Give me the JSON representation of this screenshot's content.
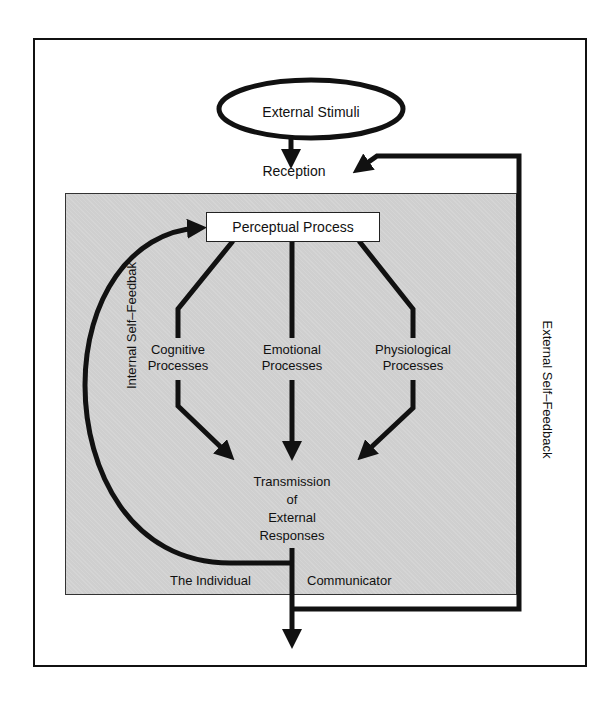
{
  "diagram": {
    "start_node": "External Stimuli",
    "reception": "Reception",
    "perceptual_process": "Perceptual Process",
    "processes": [
      {
        "line1": "Cognitive",
        "line2": "Processes"
      },
      {
        "line1": "Emotional",
        "line2": "Processes"
      },
      {
        "line1": "Physiological",
        "line2": "Processes"
      }
    ],
    "transmission": {
      "line1": "Transmission",
      "line2": "of",
      "line3": "External",
      "line4": "Responses"
    },
    "container_label_left": "The Individual",
    "container_label_right": "Communicator",
    "internal_feedback": "Internal Self–Feedbak",
    "external_feedback": "External Self–Feedback",
    "colors": {
      "stroke": "#111111",
      "container_fill": "#cfcfcf",
      "background": "#ffffff"
    }
  }
}
